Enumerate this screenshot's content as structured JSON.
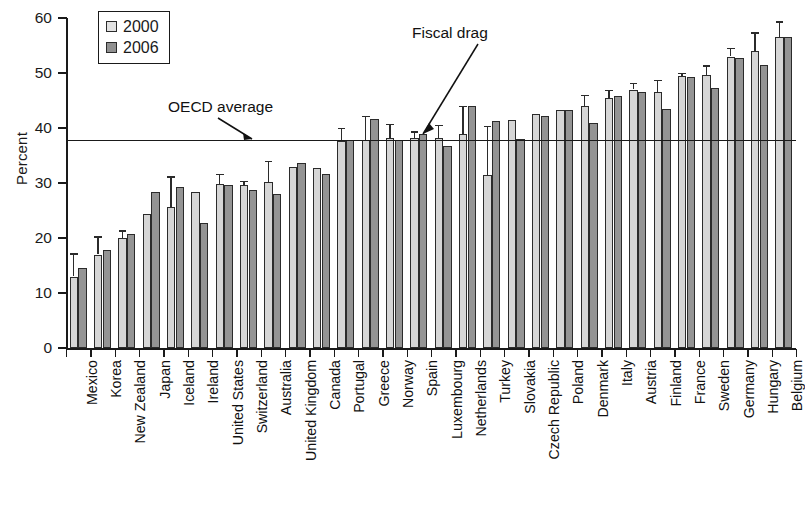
{
  "chart_data": {
    "type": "bar",
    "title": "",
    "xlabel": "",
    "ylabel": "Percent",
    "ylim": [
      0,
      60
    ],
    "yticks": [
      0,
      10,
      20,
      30,
      40,
      50,
      60
    ],
    "grid": false,
    "legend_position": "top-left",
    "orientation": "vertical",
    "error_bars": true,
    "categories": [
      "Mexico",
      "Korea",
      "New Zealand",
      "Japan",
      "Iceland",
      "Ireland",
      "United States",
      "Switzerland",
      "Australia",
      "United Kingdom",
      "Canada",
      "Portugal",
      "Greece",
      "Norway",
      "Spain",
      "Luxembourg",
      "Netherlands",
      "Turkey",
      "Slovakia",
      "Czech Republic",
      "Poland",
      "Denmark",
      "Italy",
      "Austria",
      "Finland",
      "France",
      "Sweden",
      "Germany",
      "Hungary",
      "Belgium"
    ],
    "series": [
      {
        "name": "2000",
        "color": "#d6d6d6",
        "values": [
          13.0,
          17.0,
          20.0,
          24.3,
          25.6,
          28.4,
          29.8,
          29.6,
          30.2,
          33.0,
          32.8,
          37.6,
          37.8,
          38.2,
          38.2,
          38.2,
          39.0,
          31.4,
          41.4,
          42.6,
          43.2,
          44.0,
          45.4,
          47.0,
          46.6,
          49.4,
          49.6,
          53.0,
          54.0,
          56.6
        ],
        "errors_upper": [
          4.2,
          3.3,
          1.4,
          0.0,
          5.6,
          0.0,
          1.8,
          0.8,
          3.8,
          0.0,
          0.0,
          2.4,
          4.4,
          2.6,
          1.2,
          2.4,
          5.0,
          9.0,
          0.0,
          0.0,
          0.0,
          2.0,
          1.6,
          1.2,
          2.2,
          0.6,
          1.8,
          1.6,
          3.4,
          2.8
        ]
      },
      {
        "name": "2006",
        "color": "#949494",
        "values": [
          14.5,
          17.8,
          20.7,
          28.3,
          29.2,
          22.8,
          29.6,
          28.8,
          28.0,
          33.6,
          31.6,
          37.8,
          41.6,
          37.8,
          39.0,
          36.8,
          44.0,
          41.2,
          38.0,
          42.2,
          43.2,
          41.0,
          45.8,
          46.6,
          43.4,
          49.2,
          47.2,
          52.8,
          51.4,
          56.6
        ],
        "errors_upper": [
          0.0,
          0.0,
          0.0,
          0.0,
          0.0,
          0.0,
          0.0,
          0.0,
          0.0,
          0.0,
          0.0,
          0.0,
          0.0,
          0.0,
          0.0,
          0.0,
          0.0,
          0.0,
          0.0,
          0.0,
          0.0,
          0.0,
          0.0,
          0.0,
          0.0,
          0.0,
          0.0,
          0.0,
          0.0,
          0.0
        ]
      }
    ],
    "reference_lines": [
      {
        "label": "OECD average",
        "value": 37.7,
        "orientation": "horizontal"
      }
    ],
    "annotations": [
      {
        "label": "OECD average",
        "points_to": "reference-line"
      },
      {
        "label": "Fiscal drag",
        "points_to": "Norway"
      }
    ]
  },
  "legend": {
    "entries": [
      {
        "label": "2000",
        "swatch": "light-gray-square"
      },
      {
        "label": "2006",
        "swatch": "dark-gray-square"
      }
    ]
  },
  "axes": {
    "y": {
      "label": "Percent",
      "ticks": [
        "0",
        "10",
        "20",
        "30",
        "40",
        "50",
        "60"
      ]
    }
  },
  "annotations": {
    "oecd_average": "OECD average",
    "fiscal_drag": "Fiscal drag"
  }
}
